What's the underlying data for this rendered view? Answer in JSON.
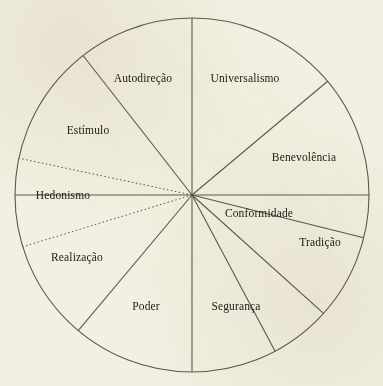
{
  "header": {
    "faint_text": ""
  },
  "chart_data": {
    "type": "pie",
    "title": "",
    "subtitle": "",
    "xlabel": "",
    "ylabel": "",
    "legend_position": "none",
    "grid": false,
    "center": {
      "x": 192,
      "y": 195
    },
    "radius": 177,
    "stroke_color": "#5d5a4c",
    "background_color": "#f3f0e2",
    "text_color": "#23201a",
    "categories": [
      "Autodireção",
      "Universalismo",
      "Benevolência",
      "Conformidade",
      "Tradição",
      "Segurança",
      "Poder",
      "Realização",
      "Hedonismo",
      "Estímulo"
    ],
    "values": [
      40,
      50,
      45,
      26,
      26,
      44,
      40,
      36,
      26,
      26
    ],
    "boundaries_deg": [
      270,
      320,
      14,
      62,
      90,
      118,
      142,
      180,
      208,
      232,
      270
    ],
    "sectors": [
      {
        "label": "Autodireção",
        "start_deg": 232,
        "end_deg": 270,
        "label_x": 143,
        "label_y": 79,
        "divider_style": "solid"
      },
      {
        "label": "Universalismo",
        "start_deg": 270,
        "end_deg": 320,
        "label_x": 245,
        "label_y": 79,
        "divider_style": "solid"
      },
      {
        "label": "Benevolência",
        "start_deg": 320,
        "end_deg": 14,
        "label_x": 304,
        "label_y": 158,
        "divider_style": "solid"
      },
      {
        "label": "Conformidade",
        "start_deg": 14,
        "end_deg": 42,
        "label_x": 259,
        "label_y": 214,
        "divider_style": "solid"
      },
      {
        "label": "Tradição",
        "start_deg": 42,
        "end_deg": 62,
        "label_x": 320,
        "label_y": 243,
        "divider_style": "solid"
      },
      {
        "label": "Segurança",
        "start_deg": 62,
        "end_deg": 90,
        "label_x": 236,
        "label_y": 307,
        "divider_style": "solid"
      },
      {
        "label": "Poder",
        "start_deg": 90,
        "end_deg": 130,
        "label_x": 146,
        "label_y": 307,
        "divider_style": "solid"
      },
      {
        "label": "Realização",
        "start_deg": 130,
        "end_deg": 163,
        "label_x": 77,
        "label_y": 258,
        "divider_style": "solid"
      },
      {
        "label": "Hedonismo",
        "start_deg": 163,
        "end_deg": 192,
        "label_x": 63,
        "label_y": 196,
        "divider_style": "dotted"
      },
      {
        "label": "Estímulo",
        "start_deg": 192,
        "end_deg": 232,
        "label_x": 88,
        "label_y": 131,
        "divider_style": "solid"
      }
    ],
    "dividers": [
      {
        "angle_deg": 270,
        "style": "solid",
        "name": "divider-top-vertical"
      },
      {
        "angle_deg": 320,
        "style": "solid",
        "name": "divider-universalismo-benevolencia"
      },
      {
        "angle_deg": 14,
        "style": "solid",
        "name": "divider-benevolencia-conformidade"
      },
      {
        "angle_deg": 42,
        "style": "solid",
        "name": "divider-conformidade-tradicao"
      },
      {
        "angle_deg": 62,
        "style": "solid",
        "name": "divider-tradicao-seguranca"
      },
      {
        "angle_deg": 90,
        "style": "solid",
        "name": "divider-bottom-vertical"
      },
      {
        "angle_deg": 130,
        "style": "solid",
        "name": "divider-poder-realizacao"
      },
      {
        "angle_deg": 163,
        "style": "dotted",
        "name": "divider-realizacao-hedonismo"
      },
      {
        "angle_deg": 192,
        "style": "dotted",
        "name": "divider-hedonismo-estimulo"
      },
      {
        "angle_deg": 232,
        "style": "solid",
        "name": "divider-estimulo-autodirecao"
      },
      {
        "angle_deg": 0,
        "style": "solid",
        "name": "divider-right-horizontal"
      },
      {
        "angle_deg": 180,
        "style": "solid",
        "name": "divider-left-horizontal"
      }
    ]
  }
}
